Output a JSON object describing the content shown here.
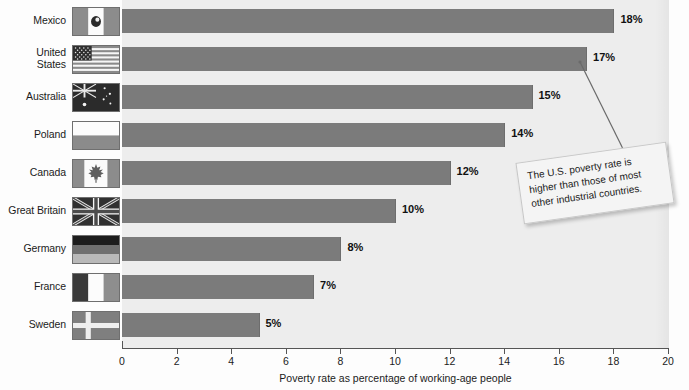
{
  "chart_data": {
    "type": "bar",
    "orientation": "horizontal",
    "title": "",
    "xlabel": "Poverty rate as percentage of working-age people",
    "ylabel": "",
    "xlim": [
      0,
      20
    ],
    "xticks": [
      0,
      2,
      4,
      6,
      8,
      10,
      12,
      14,
      16,
      18,
      20
    ],
    "grid": false,
    "legend": null,
    "value_suffix": "%",
    "categories": [
      "Mexico",
      "United States",
      "Australia",
      "Poland",
      "Canada",
      "Great Britain",
      "Germany",
      "France",
      "Sweden"
    ],
    "values": [
      18,
      17,
      15,
      14,
      12,
      10,
      8,
      7,
      5
    ],
    "value_labels": [
      "18%",
      "17%",
      "15%",
      "14%",
      "12%",
      "10%",
      "8%",
      "7%",
      "5%"
    ],
    "bar_color": "#7b7b7b",
    "plot_background": "#ededed",
    "annotations": [
      {
        "text": "The U.S. poverty rate is higher than those of most other industrial countries.",
        "points_to_category": "United States",
        "points_to_value": 17
      }
    ]
  },
  "rows": [
    {
      "label": "Mexico",
      "label_lines": "Mexico",
      "value": 18,
      "value_label": "18%",
      "flag": "flag-mexico"
    },
    {
      "label": "United States",
      "label_lines": "United\nStates",
      "value": 17,
      "value_label": "17%",
      "flag": "flag-united-states"
    },
    {
      "label": "Australia",
      "label_lines": "Australia",
      "value": 15,
      "value_label": "15%",
      "flag": "flag-australia"
    },
    {
      "label": "Poland",
      "label_lines": "Poland",
      "value": 14,
      "value_label": "14%",
      "flag": "flag-poland"
    },
    {
      "label": "Canada",
      "label_lines": "Canada",
      "value": 12,
      "value_label": "12%",
      "flag": "flag-canada"
    },
    {
      "label": "Great Britain",
      "label_lines": "Great Britain",
      "value": 10,
      "value_label": "10%",
      "flag": "flag-great-britain"
    },
    {
      "label": "Germany",
      "label_lines": "Germany",
      "value": 8,
      "value_label": "8%",
      "flag": "flag-germany"
    },
    {
      "label": "France",
      "label_lines": "France",
      "value": 7,
      "value_label": "7%",
      "flag": "flag-france"
    },
    {
      "label": "Sweden",
      "label_lines": "Sweden",
      "value": 5,
      "value_label": "5%",
      "flag": "flag-sweden"
    }
  ],
  "axis": {
    "title": "Poverty rate as percentage of working-age people",
    "ticks": [
      "0",
      "2",
      "4",
      "6",
      "8",
      "10",
      "12",
      "14",
      "16",
      "18",
      "20"
    ]
  },
  "callout": {
    "text": "The U.S. poverty rate is higher than those of most other industrial countries."
  }
}
